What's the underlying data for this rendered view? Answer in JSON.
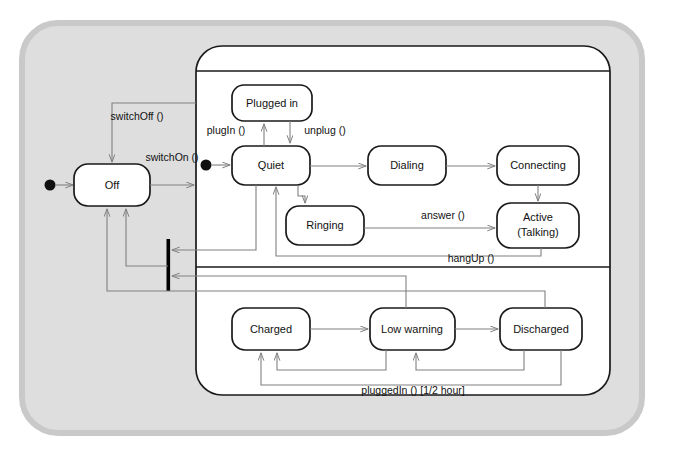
{
  "diagram": {
    "type": "uml-state-machine",
    "title": "",
    "colors": {
      "outer_fill": "#dedede",
      "outer_border": "#c9c9c9",
      "page_bg": "#ffffff",
      "state_fill": "#ffffff",
      "state_border": "#1a1a1a",
      "arrow": "#808080",
      "text": "#111111",
      "bar": "#000000"
    },
    "outer_frame": {
      "name": "device-frame",
      "shape": "rounded-rectangle"
    },
    "top_level_states": [
      {
        "id": "off",
        "label": "Off"
      }
    ],
    "composite_state": {
      "name": "on-composite-state",
      "label": "",
      "regions": [
        {
          "name": "call-region",
          "initial_state": "Quiet",
          "states": [
            {
              "id": "plugged-in",
              "label": "Plugged in"
            },
            {
              "id": "quiet",
              "label": "Quiet"
            },
            {
              "id": "dialing",
              "label": "Dialing"
            },
            {
              "id": "connecting",
              "label": "Connecting"
            },
            {
              "id": "ringing",
              "label": "Ringing"
            },
            {
              "id": "active",
              "label": "Active",
              "label2": "(Talking)"
            }
          ]
        },
        {
          "name": "battery-region",
          "states": [
            {
              "id": "charged",
              "label": "Charged"
            },
            {
              "id": "low-warning",
              "label": "Low warning"
            },
            {
              "id": "discharged",
              "label": "Discharged"
            }
          ]
        }
      ]
    },
    "transitions": [
      {
        "id": "t-switch-off",
        "label": "switchOff ()"
      },
      {
        "id": "t-switch-on",
        "label": "switchOn ()"
      },
      {
        "id": "t-plug-in",
        "label": "plugIn ()"
      },
      {
        "id": "t-unplug",
        "label": "unplug ()"
      },
      {
        "id": "t-answer",
        "label": "answer ()"
      },
      {
        "id": "t-hang-up",
        "label": "hangUp ()"
      },
      {
        "id": "t-plugged-in",
        "label": "pluggedIn () [1/2 hour]"
      }
    ],
    "pseudostates": [
      {
        "id": "initial-outer",
        "kind": "initial"
      },
      {
        "id": "initial-call-region",
        "kind": "initial"
      },
      {
        "id": "exit-bar",
        "kind": "join-bar"
      }
    ]
  }
}
